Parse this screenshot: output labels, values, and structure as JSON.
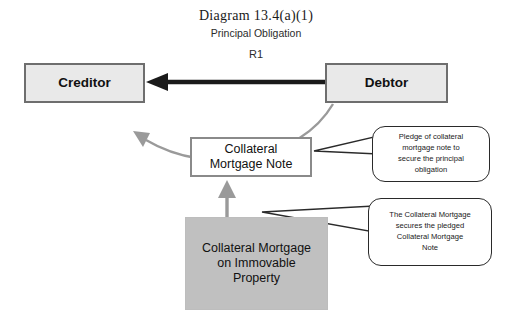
{
  "diagram": {
    "title": "Diagram  13.4(a)(1)",
    "subtitle": "Principal Obligation",
    "relation_label": "R1",
    "background": "#ffffff"
  },
  "nodes": {
    "creditor": {
      "label": "Creditor",
      "fill": "#e9e9e9",
      "border": "#6e6e6e"
    },
    "debtor": {
      "label": "Debtor",
      "fill": "#e9e9e9",
      "border": "#6e6e6e"
    },
    "note": {
      "line1": "Collateral",
      "line2": "Mortgage Note",
      "fill": "#ffffff",
      "border": "#8a8a8a"
    },
    "mortgage": {
      "line1": "Collateral Mortgage",
      "line2": "on Immovable",
      "line3": "Property",
      "fill": "#c0c0c0",
      "border": "#bdbdbd"
    }
  },
  "callouts": {
    "pledge": {
      "line1": "Pledge of collateral",
      "line2": "mortgage note to",
      "line3": "secure the principal",
      "line4": "obligation"
    },
    "secures": {
      "line1": "The Collateral Mortgage",
      "line2": "secures the pledged",
      "line3": "Collateral Mortgage",
      "line4": "Note"
    }
  },
  "connectors": {
    "debtor_to_creditor": {
      "name": "principal-obligation-arrow",
      "color": "#1a1a1a"
    },
    "debtor_to_note_curve": {
      "name": "pledge-curve-arrow",
      "color": "#9a9a9a"
    },
    "mortgage_to_note": {
      "name": "secures-arrow",
      "color": "#9a9a9a"
    }
  }
}
